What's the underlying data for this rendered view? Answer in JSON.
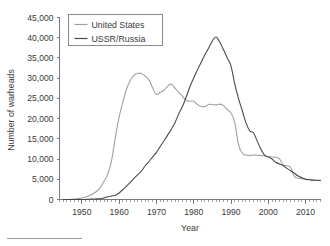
{
  "chart_data": {
    "type": "line",
    "title": "",
    "xlabel": "Year",
    "ylabel": "Number of warheads",
    "xlim": [
      1944,
      2014
    ],
    "ylim": [
      0,
      45000
    ],
    "xticks": [
      1950,
      1960,
      1970,
      1980,
      1990,
      2000,
      2010
    ],
    "xtick_labels": [
      "1950",
      "1960",
      "1970",
      "1980",
      "1990",
      "2000",
      "2010"
    ],
    "x_minor_tick_step": 1,
    "yticks": [
      0,
      5000,
      10000,
      15000,
      20000,
      25000,
      30000,
      35000,
      40000,
      45000
    ],
    "ytick_labels": [
      "0",
      "5,000",
      "10,000",
      "15,000",
      "20,000",
      "25,000",
      "30,000",
      "35,000",
      "40,000",
      "45,000"
    ],
    "grid": false,
    "legend_position": "top-left",
    "series": [
      {
        "name": "United States",
        "color": "#a0a0a0",
        "x": [
          1945,
          1946,
          1947,
          1948,
          1949,
          1950,
          1951,
          1952,
          1953,
          1954,
          1955,
          1956,
          1957,
          1958,
          1959,
          1960,
          1961,
          1962,
          1963,
          1964,
          1965,
          1966,
          1967,
          1968,
          1969,
          1970,
          1971,
          1972,
          1973,
          1974,
          1975,
          1976,
          1977,
          1978,
          1979,
          1980,
          1981,
          1982,
          1983,
          1984,
          1985,
          1986,
          1987,
          1988,
          1989,
          1990,
          1991,
          1992,
          1993,
          1994,
          1995,
          1996,
          1997,
          1998,
          1999,
          2000,
          2001,
          2002,
          2003,
          2004,
          2005,
          2006,
          2007,
          2008,
          2009,
          2010,
          2011,
          2012,
          2013,
          2014
        ],
        "values": [
          6,
          11,
          32,
          110,
          235,
          369,
          640,
          1005,
          1436,
          2063,
          3057,
          4618,
          6444,
          9822,
          15468,
          20434,
          24111,
          27387,
          29459,
          30751,
          31139,
          31175,
          30460,
          29561,
          27552,
          26008,
          26500,
          27000,
          28000,
          28500,
          27500,
          26500,
          25500,
          24500,
          24300,
          24300,
          23500,
          23000,
          23000,
          23500,
          23500,
          23400,
          23575,
          23205,
          22217,
          21392,
          19008,
          13708,
          11511,
          10979,
          10904,
          11000,
          10950,
          10871,
          10800,
          10577,
          10526,
          10457,
          10027,
          8570,
          8360,
          7853,
          5709,
          5273,
          5113,
          5000,
          4950,
          4800,
          4760,
          4717
        ]
      },
      {
        "name": "USSR/Russia",
        "color": "#4a4a4a",
        "x": [
          1945,
          1946,
          1947,
          1948,
          1949,
          1950,
          1951,
          1952,
          1953,
          1954,
          1955,
          1956,
          1957,
          1958,
          1959,
          1960,
          1961,
          1962,
          1963,
          1964,
          1965,
          1966,
          1967,
          1968,
          1969,
          1970,
          1971,
          1972,
          1973,
          1974,
          1975,
          1976,
          1977,
          1978,
          1979,
          1980,
          1981,
          1982,
          1983,
          1984,
          1985,
          1986,
          1987,
          1988,
          1989,
          1990,
          1991,
          1992,
          1993,
          1994,
          1995,
          1996,
          1997,
          1998,
          1999,
          2000,
          2001,
          2002,
          2003,
          2004,
          2005,
          2006,
          2007,
          2008,
          2009,
          2010,
          2011,
          2012,
          2013,
          2014
        ],
        "values": [
          0,
          0,
          0,
          0,
          1,
          5,
          25,
          50,
          120,
          150,
          200,
          426,
          660,
          869,
          1060,
          1605,
          2471,
          3322,
          4238,
          5221,
          6129,
          7089,
          8339,
          9399,
          10538,
          11643,
          13092,
          14478,
          15915,
          17385,
          19055,
          21205,
          23044,
          25393,
          27935,
          30062,
          32049,
          33952,
          35804,
          37431,
          39197,
          40159,
          38859,
          37000,
          35000,
          33000,
          28595,
          25000,
          22000,
          19000,
          17000,
          16500,
          14500,
          12500,
          11000,
          10500,
          10000,
          9200,
          8800,
          8400,
          7700,
          7100,
          6500,
          5800,
          5400,
          5000,
          4900,
          4800,
          4750,
          4700
        ]
      }
    ]
  },
  "legend": {
    "items": [
      {
        "label": "United States",
        "color": "#a0a0a0"
      },
      {
        "label": "USSR/Russia",
        "color": "#4a4a4a"
      }
    ]
  },
  "axes": {
    "x_title": "Year",
    "y_title": "Number of warheads"
  }
}
